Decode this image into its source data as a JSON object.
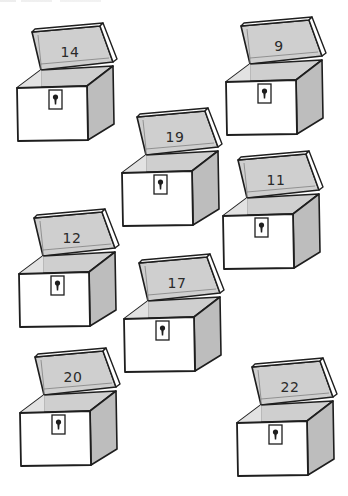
{
  "worksheet": {
    "colors": {
      "background": "#ffffff",
      "line": "#1e1e1e",
      "shade": "#cfcfcf",
      "shade_dark": "#bdbdbd",
      "number": "#2a2a2a"
    },
    "chests": [
      {
        "number": "14",
        "x": 15,
        "y": 26
      },
      {
        "number": "9",
        "x": 224,
        "y": 20
      },
      {
        "number": "19",
        "x": 120,
        "y": 111
      },
      {
        "number": "11",
        "x": 221,
        "y": 154
      },
      {
        "number": "12",
        "x": 17,
        "y": 212
      },
      {
        "number": "17",
        "x": 122,
        "y": 257
      },
      {
        "number": "20",
        "x": 18,
        "y": 351
      },
      {
        "number": "22",
        "x": 235,
        "y": 361
      }
    ]
  }
}
